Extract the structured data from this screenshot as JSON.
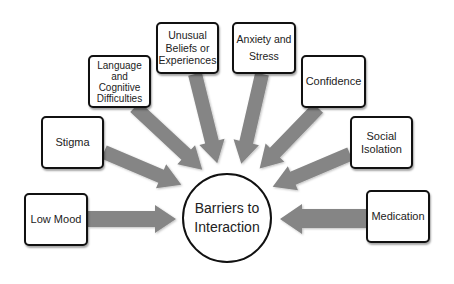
{
  "diagram": {
    "center": {
      "label": "Barriers to\nInteraction"
    },
    "arrow_color": "#858585",
    "nodes": [
      {
        "id": "low-mood",
        "label": "Low Mood"
      },
      {
        "id": "stigma",
        "label": "Stigma"
      },
      {
        "id": "language",
        "label": "Language\nand\nCognitive\nDifficulties"
      },
      {
        "id": "unusual-beliefs",
        "label": "Unusual\nBeliefs or\nExperiences"
      },
      {
        "id": "anxiety",
        "label": "Anxiety and\nStress"
      },
      {
        "id": "confidence",
        "label": "Confidence"
      },
      {
        "id": "social-isolation",
        "label": "Social\nIsolation"
      },
      {
        "id": "medication",
        "label": "Medication"
      }
    ]
  }
}
